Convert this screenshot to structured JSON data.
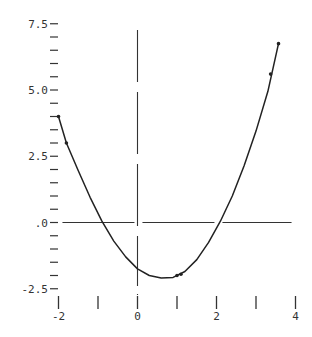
{
  "chart_data": {
    "type": "line",
    "title": "",
    "xlabel": "",
    "ylabel": "",
    "xlim": [
      -2,
      4
    ],
    "ylim": [
      -2.5,
      7.5
    ],
    "grid": false,
    "legend": null,
    "x_ticks": [
      -2,
      -1,
      0,
      1,
      2,
      3,
      4
    ],
    "x_tick_labels": [
      {
        "value": -2,
        "label": "-2"
      },
      {
        "value": 0,
        "label": "0"
      },
      {
        "value": 2,
        "label": "2"
      },
      {
        "value": 4,
        "label": "4"
      }
    ],
    "y_ticks_step": 0.5,
    "y_tick_labels": [
      {
        "value": 7.5,
        "label": "7.5"
      },
      {
        "value": 5.0,
        "label": "5.0"
      },
      {
        "value": 2.5,
        "label": "2.5"
      },
      {
        "value": 0.0,
        "label": ".0"
      },
      {
        "value": -2.5,
        "label": "-2.5"
      }
    ],
    "series": [
      {
        "name": "curve",
        "style": "line",
        "color": "#222222",
        "x": [
          -2.0,
          -1.8,
          -1.5,
          -1.2,
          -0.9,
          -0.6,
          -0.3,
          0.0,
          0.3,
          0.6,
          0.9,
          1.2,
          1.5,
          1.8,
          2.1,
          2.4,
          2.7,
          3.0,
          3.3,
          3.57
        ],
        "y": [
          4.0,
          3.0,
          1.95,
          0.95,
          0.05,
          -0.7,
          -1.3,
          -1.75,
          -2.0,
          -2.1,
          -2.07,
          -1.85,
          -1.4,
          -0.75,
          0.05,
          1.0,
          2.15,
          3.45,
          4.95,
          6.75
        ]
      },
      {
        "name": "data points",
        "style": "markers",
        "color": "#222222",
        "x": [
          -2.0,
          -1.8,
          1.0,
          1.1,
          3.37,
          3.57
        ],
        "y": [
          4.0,
          3.0,
          -2.0,
          -1.95,
          5.6,
          6.75
        ]
      }
    ],
    "axes": {
      "vertical_axis_at_x": 0,
      "horizontal_axis_at_y": 0,
      "vertical_axis_style": "long-dash",
      "horizontal_axis_range_x": [
        -1.9,
        3.9
      ]
    }
  }
}
